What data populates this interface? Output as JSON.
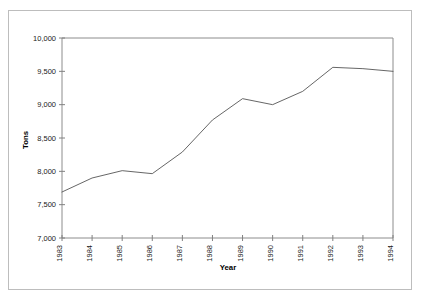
{
  "chart_data": {
    "type": "line",
    "title": "",
    "xlabel": "Year",
    "ylabel": "Tons",
    "x": [
      1983,
      1984,
      1985,
      1986,
      1987,
      1988,
      1989,
      1990,
      1991,
      1992,
      1993,
      1994
    ],
    "categories": [
      "1983",
      "1984",
      "1985",
      "1986",
      "1987",
      "1988",
      "1989",
      "1990",
      "1991",
      "1992",
      "1993",
      "1994"
    ],
    "values": [
      7690,
      7900,
      8010,
      7965,
      8290,
      8770,
      9090,
      9000,
      9200,
      9560,
      9540,
      9500
    ],
    "series": [
      {
        "name": "Tons",
        "values": [
          7690,
          7900,
          8010,
          7965,
          8290,
          8770,
          9090,
          9000,
          9200,
          9560,
          9540,
          9500
        ]
      }
    ],
    "ylim": [
      7000,
      10000
    ],
    "ytick_step": 500,
    "ytick_labels": [
      "10,000",
      "9,500",
      "9,000",
      "8,500",
      "8,000",
      "7,500",
      "7,000"
    ],
    "ytick_values": [
      10000,
      9500,
      9000,
      8500,
      8000,
      7500,
      7000
    ],
    "xtick_labels": [
      "1983",
      "1984",
      "1985",
      "1986",
      "1987",
      "1988",
      "1989",
      "1990",
      "1991",
      "1992",
      "1993",
      "1994"
    ],
    "xtick_rotation": 90,
    "grid": false,
    "legend": false,
    "legend_position": "none",
    "line_color": "#555555",
    "axis_color": "#808080",
    "frame_color": "#bdbdbd",
    "background_color": "#ffffff"
  },
  "axes": {
    "y_title": "Tons",
    "x_title": "Year"
  }
}
